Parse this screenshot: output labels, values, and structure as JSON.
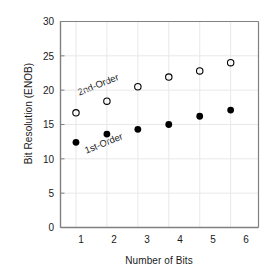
{
  "chart_data": {
    "type": "scatter",
    "title": "",
    "xlabel": "Number of Bits",
    "ylabel": "Bit Resolution (ENOB)",
    "x": [
      1,
      2,
      3,
      4,
      5,
      6
    ],
    "xlim": [
      0.5,
      6.9
    ],
    "ylim": [
      0,
      30
    ],
    "xticks": [
      "1",
      "2",
      "3",
      "4",
      "5",
      "6"
    ],
    "yticks": [
      "0",
      "5",
      "10",
      "15",
      "20",
      "25",
      "30"
    ],
    "grid": true,
    "legend_position": "inline-annotations",
    "series": [
      {
        "name": "1st-Order",
        "marker": "filled-circle",
        "color": "#000000",
        "values": [
          12.4,
          13.6,
          14.3,
          15.0,
          16.2,
          17.1
        ]
      },
      {
        "name": "2nd-Order",
        "marker": "open-circle",
        "color": "#000000",
        "values": [
          16.7,
          18.4,
          20.5,
          21.9,
          22.8,
          24.0
        ]
      }
    ],
    "annotations": [
      {
        "text": "2nd-Order",
        "x": 1.05,
        "y": 19.6,
        "rotation": -22
      },
      {
        "text": "1st-Order",
        "x": 1.3,
        "y": 11.1,
        "rotation": -22
      }
    ],
    "colors": {
      "axis": "#808080",
      "grid": "#e8e8e8",
      "text": "#1a1a1a",
      "marker": "#000000",
      "background": "#ffffff"
    }
  }
}
